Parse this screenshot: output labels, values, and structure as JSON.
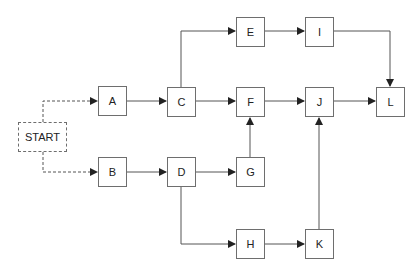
{
  "diagram": {
    "type": "network-flow",
    "nodes": [
      {
        "id": "START",
        "label": "START",
        "x": 18,
        "y": 122,
        "w": 49,
        "h": 30,
        "style": "dashed"
      },
      {
        "id": "A",
        "label": "A",
        "x": 98,
        "y": 86,
        "w": 29,
        "h": 30
      },
      {
        "id": "B",
        "label": "B",
        "x": 98,
        "y": 157,
        "w": 29,
        "h": 30
      },
      {
        "id": "C",
        "label": "C",
        "x": 167,
        "y": 87,
        "w": 29,
        "h": 30
      },
      {
        "id": "D",
        "label": "D",
        "x": 167,
        "y": 157,
        "w": 29,
        "h": 30
      },
      {
        "id": "E",
        "label": "E",
        "x": 236,
        "y": 17,
        "w": 29,
        "h": 30
      },
      {
        "id": "F",
        "label": "F",
        "x": 236,
        "y": 87,
        "w": 29,
        "h": 30
      },
      {
        "id": "G",
        "label": "G",
        "x": 236,
        "y": 157,
        "w": 29,
        "h": 30
      },
      {
        "id": "H",
        "label": "H",
        "x": 236,
        "y": 229,
        "w": 29,
        "h": 30
      },
      {
        "id": "I",
        "label": "I",
        "x": 305,
        "y": 17,
        "w": 29,
        "h": 30
      },
      {
        "id": "J",
        "label": "J",
        "x": 305,
        "y": 87,
        "w": 29,
        "h": 30
      },
      {
        "id": "K",
        "label": "K",
        "x": 305,
        "y": 229,
        "w": 29,
        "h": 30
      },
      {
        "id": "L",
        "label": "L",
        "x": 376,
        "y": 87,
        "w": 29,
        "h": 30
      }
    ],
    "edges": [
      {
        "from": "START",
        "to": "A",
        "style": "dashed"
      },
      {
        "from": "START",
        "to": "B",
        "style": "dashed"
      },
      {
        "from": "A",
        "to": "C"
      },
      {
        "from": "B",
        "to": "D"
      },
      {
        "from": "C",
        "to": "E"
      },
      {
        "from": "C",
        "to": "F"
      },
      {
        "from": "D",
        "to": "G"
      },
      {
        "from": "D",
        "to": "H"
      },
      {
        "from": "E",
        "to": "I"
      },
      {
        "from": "F",
        "to": "J"
      },
      {
        "from": "G",
        "to": "F"
      },
      {
        "from": "H",
        "to": "K"
      },
      {
        "from": "I",
        "to": "L"
      },
      {
        "from": "J",
        "to": "L"
      },
      {
        "from": "K",
        "to": "J"
      }
    ]
  },
  "colors": {
    "line": "#555555",
    "border": "#6e6e6e"
  }
}
